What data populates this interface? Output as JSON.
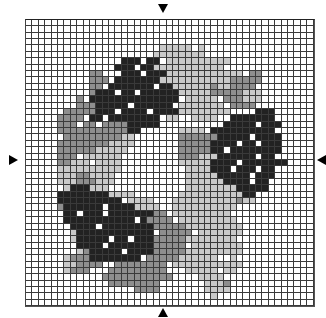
{
  "pattern": {
    "cols": 45,
    "rows": 45,
    "legend": {
      ".": "white",
      "l": "light-gray",
      "m": "medium-gray",
      "d": "dark"
    },
    "colors": {
      "white": "#ffffff",
      "light-gray": "#c9c9c9",
      "medium-gray": "#8e8e8e",
      "dark": "#222222",
      "grid-line": "#3a3a3a"
    },
    "grid": [
      ".............................................",
      ".............................................",
      ".............................................",
      ".............................................",
      ".....................lllll.l.................",
      "....................llllllll.................",
      "...............ddd.dd.llllllllll.............",
      "..............ddd.ddlllllllllll..............",
      "..........mm...ddd.dddllllllllllll.mm........",
      "..........mmm.dddddddlllllllllllmmmmm........",
      "..........mm.ddddddd.ddllllllmllmmmm.........",
      "..........mddd.dd.ddddddlllllmmmmmlll........",
      "........m.dddddddddddddd.lllll.mmmlll........",
      "........mmmddddd.dddddd.lllllll.mmmm.........",
      "......mmmmmddd.dddd.ddddllllllll....ddd......",
      ".....mmmm.dd.dddddddd.ll..llll..ddddddd......",
      ".....mmm.mm.mmmmddddd..........ddddd.ddd.....",
      ".....mmmmmmmmmmmdd......llll.dddddddddd......",
      "......mmmmmmmmmll.......mmmmmmddddd.dddd.....",
      ".....mmmmmmmmllll.......mmmmmdddd.dd.ddd.....",
      ".....mmmmmmlllll........mmmmmdd.dddddddd.....",
      ".....mmm.llllll.........mmmllldddddd.dd......",
      ".....mmlll.llll.........llllldddd.ddddddd....",
      ".....llllllllll..........llllddd.ddd.dd......",
      ".....lllmmllll...........lllllddddd.ddd......",
      ".....lllmmmlll...........lllllldddd.dd.......",
      "......ldddlll............llllllllddddd.......",
      ".....ddddddddllll.......lllllllllldd.........",
      ".....dddddddddd.llll...llllllllllmll.........",
      ".....mdddddd.ddddllll..llllllllll............",
      "......dd.ddd.dddddddmm.lllllllll.............",
      "......ddddddddddd.dmmmm.lllllllll............",
      ".......dddd.ddddddddmmmmmlllllllll...........",
      ".......ldddddddddddd.mmmmm.lllllll...........",
      ".......lddddd.dd.dddmmmmmllllllll............",
      "........dddd.dddddddmmmmm.llllllll...........",
      "........lmddddd.ddddmmmmmlllllllll...........",
      "......lmmmdddddddd.mmmmmllllll..l............",
      "......llmmmm..mmmmmmmm.lllllllllll...........",
      "......lmmm...mmmmmmmmm...lllll.ll............",
      "............mmmmmmmmmmm....llll..............",
      ".............mmmmmmmm.......lllm.............",
      ".................mmmm.......llll.............",
      ".............................l...............",
      "............................................."
    ]
  },
  "markers": {
    "top": "arrow-down",
    "bottom": "arrow-up",
    "left": "arrow-right",
    "right": "arrow-left"
  }
}
